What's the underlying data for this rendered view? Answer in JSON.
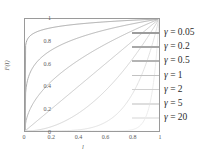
{
  "chart_data": {
    "type": "line",
    "title": "",
    "xlabel": "l",
    "ylabel": "F(l)",
    "xlim": [
      0,
      1
    ],
    "ylim": [
      0,
      1
    ],
    "grid": false,
    "legend_position": "right",
    "xticks": [
      "0",
      "0.2",
      "0.4",
      "0.6",
      "0.8",
      "1"
    ],
    "yticks": [
      "0",
      "0.2",
      "0.4",
      "0.6",
      "0.8",
      "1"
    ],
    "x": [
      0,
      0.05,
      0.1,
      0.15,
      0.2,
      0.25,
      0.3,
      0.35,
      0.4,
      0.45,
      0.5,
      0.55,
      0.6,
      0.65,
      0.7,
      0.75,
      0.8,
      0.85,
      0.9,
      0.95,
      1
    ],
    "series": [
      {
        "name": "γ = 0.05",
        "gamma": 0.05,
        "color": "#9c9c9c",
        "values": [
          0,
          0.861,
          0.891,
          0.909,
          0.921,
          0.931,
          0.942,
          0.949,
          0.955,
          0.961,
          0.966,
          0.971,
          0.975,
          0.979,
          0.982,
          0.986,
          0.989,
          0.992,
          0.995,
          0.997,
          1
        ]
      },
      {
        "name": "γ = 0.2",
        "gamma": 0.2,
        "color": "#a8a8a8",
        "values": [
          0,
          0.549,
          0.631,
          0.684,
          0.725,
          0.758,
          0.786,
          0.81,
          0.832,
          0.851,
          0.871,
          0.886,
          0.903,
          0.917,
          0.931,
          0.944,
          0.956,
          0.968,
          0.979,
          0.99,
          1
        ]
      },
      {
        "name": "γ = 0.5",
        "gamma": 0.5,
        "color": "#b4b4b4",
        "values": [
          0,
          0.224,
          0.316,
          0.387,
          0.447,
          0.5,
          0.548,
          0.592,
          0.632,
          0.671,
          0.707,
          0.742,
          0.775,
          0.806,
          0.837,
          0.866,
          0.894,
          0.922,
          0.949,
          0.975,
          1
        ]
      },
      {
        "name": "γ = 1",
        "gamma": 1,
        "color": "#c2c2c2",
        "values": [
          0,
          0.05,
          0.1,
          0.15,
          0.2,
          0.25,
          0.3,
          0.35,
          0.4,
          0.45,
          0.5,
          0.55,
          0.6,
          0.65,
          0.7,
          0.75,
          0.8,
          0.85,
          0.9,
          0.95,
          1
        ]
      },
      {
        "name": "γ = 2",
        "gamma": 2,
        "color": "#d0d0d0",
        "values": [
          0,
          0.0025,
          0.01,
          0.0225,
          0.04,
          0.0625,
          0.09,
          0.1225,
          0.16,
          0.2025,
          0.25,
          0.3025,
          0.36,
          0.4225,
          0.49,
          0.5625,
          0.64,
          0.7225,
          0.81,
          0.9025,
          1
        ]
      },
      {
        "name": "γ = 5",
        "gamma": 5,
        "color": "#dedede",
        "values": [
          0,
          3e-07,
          1e-05,
          8e-05,
          0.00032,
          0.00098,
          0.00243,
          0.00525,
          0.01024,
          0.01845,
          0.03125,
          0.05033,
          0.07776,
          0.11603,
          0.16807,
          0.2373,
          0.32768,
          0.44371,
          0.59049,
          0.77378,
          1
        ]
      },
      {
        "name": "γ = 20",
        "gamma": 20,
        "color": "#eaeaea",
        "values": [
          0,
          0,
          0,
          0,
          0,
          0,
          0,
          0,
          0,
          0,
          1e-06,
          7e-06,
          3.66e-05,
          0.00018,
          0.000798,
          0.00317,
          0.01153,
          0.03876,
          0.12158,
          0.35849,
          1
        ]
      }
    ]
  },
  "axes": {
    "xticks": [
      "0",
      "0.2",
      "0.4",
      "0.6",
      "0.8",
      "1"
    ],
    "yticks": [
      "1",
      "0.8",
      "0.6",
      "0.4",
      "0.2",
      "0"
    ],
    "xlabel": "l",
    "ylabel": "F(l)"
  },
  "legend": {
    "entries": [
      {
        "gamma_symbol": "γ",
        "equals": "=",
        "value": "0.05",
        "color": "#9c9c9c"
      },
      {
        "gamma_symbol": "γ",
        "equals": "=",
        "value": "0.2",
        "color": "#a8a8a8"
      },
      {
        "gamma_symbol": "γ",
        "equals": "=",
        "value": "0.5",
        "color": "#b4b4b4"
      },
      {
        "gamma_symbol": "γ",
        "equals": "=",
        "value": "1",
        "color": "#c2c2c2"
      },
      {
        "gamma_symbol": "γ",
        "equals": "=",
        "value": "2",
        "color": "#d0d0d0"
      },
      {
        "gamma_symbol": "γ",
        "equals": "=",
        "value": "5",
        "color": "#dedede"
      },
      {
        "gamma_symbol": "γ",
        "equals": "=",
        "value": "20",
        "color": "#eaeaea"
      }
    ]
  }
}
